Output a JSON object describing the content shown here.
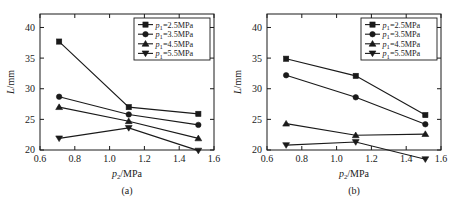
{
  "figure": {
    "panels": [
      {
        "caption": "(a)",
        "chart_data": {
          "type": "line",
          "title": "",
          "xlabel": "p2/MPa",
          "ylabel": "L/mm",
          "xlim": [
            0.6,
            1.6
          ],
          "ylim": [
            20,
            40
          ],
          "xticks": [
            "0.6",
            "0.8",
            "1.0",
            "1.2",
            "1.4",
            "1.6"
          ],
          "xtick_values": [
            0.6,
            0.8,
            1.0,
            1.2,
            1.4,
            1.6
          ],
          "yticks": [
            "20",
            "25",
            "30",
            "35",
            "40"
          ],
          "ytick_values": [
            20,
            25,
            30,
            35,
            40
          ],
          "grid": false,
          "legend_position": "top-right",
          "x": [
            0.71,
            1.11,
            1.51
          ],
          "series": [
            {
              "name": "p1=2.5MPa",
              "marker": "square",
              "values": [
                37.7,
                27.0,
                25.9
              ]
            },
            {
              "name": "p1=3.5MPa",
              "marker": "circle",
              "values": [
                28.7,
                25.8,
                24.1
              ]
            },
            {
              "name": "p1=4.5MPa",
              "marker": "triangle-up",
              "values": [
                27.0,
                24.7,
                21.9
              ]
            },
            {
              "name": "p1=5.5MPa",
              "marker": "triangle-down",
              "values": [
                21.9,
                23.6,
                19.9
              ]
            }
          ]
        }
      },
      {
        "caption": "(b)",
        "chart_data": {
          "type": "line",
          "title": "",
          "xlabel": "p2/MPa",
          "ylabel": "L/mm",
          "xlim": [
            0.6,
            1.6
          ],
          "ylim": [
            20,
            40
          ],
          "xticks": [
            "0.6",
            "0.8",
            "1.0",
            "1.2",
            "1.4",
            "1.6"
          ],
          "xtick_values": [
            0.6,
            0.8,
            1.0,
            1.2,
            1.4,
            1.6
          ],
          "yticks": [
            "20",
            "25",
            "30",
            "35",
            "40"
          ],
          "ytick_values": [
            20,
            25,
            30,
            35,
            40
          ],
          "grid": false,
          "legend_position": "top-right",
          "x": [
            0.71,
            1.11,
            1.51
          ],
          "series": [
            {
              "name": "p1=2.5MPa",
              "marker": "square",
              "values": [
                34.9,
                32.1,
                25.7
              ]
            },
            {
              "name": "p1=3.5MPa",
              "marker": "circle",
              "values": [
                32.2,
                28.6,
                24.2
              ]
            },
            {
              "name": "p1=4.5MPa",
              "marker": "triangle-up",
              "values": [
                24.3,
                22.4,
                22.6
              ]
            },
            {
              "name": "p1=5.5MPa",
              "marker": "triangle-down",
              "values": [
                20.8,
                21.3,
                18.5
              ]
            }
          ]
        }
      }
    ],
    "legend_entries": [
      {
        "symbol_var": "p",
        "symbol_sub": "1",
        "text": "=2.5MPa",
        "marker": "square"
      },
      {
        "symbol_var": "p",
        "symbol_sub": "1",
        "text": "=3.5MPa",
        "marker": "circle"
      },
      {
        "symbol_var": "p",
        "symbol_sub": "1",
        "text": "=4.5MPa",
        "marker": "triangle-up"
      },
      {
        "symbol_var": "p",
        "symbol_sub": "1",
        "text": "=5.5MPa",
        "marker": "triangle-down"
      }
    ],
    "axis_label_parts": {
      "x_var": "p",
      "x_sub": "2",
      "x_unit": "/MPa",
      "y_var": "L",
      "y_unit": "/mm"
    },
    "colors": {
      "ink": "#1a1a1a",
      "background": "#ffffff"
    }
  }
}
